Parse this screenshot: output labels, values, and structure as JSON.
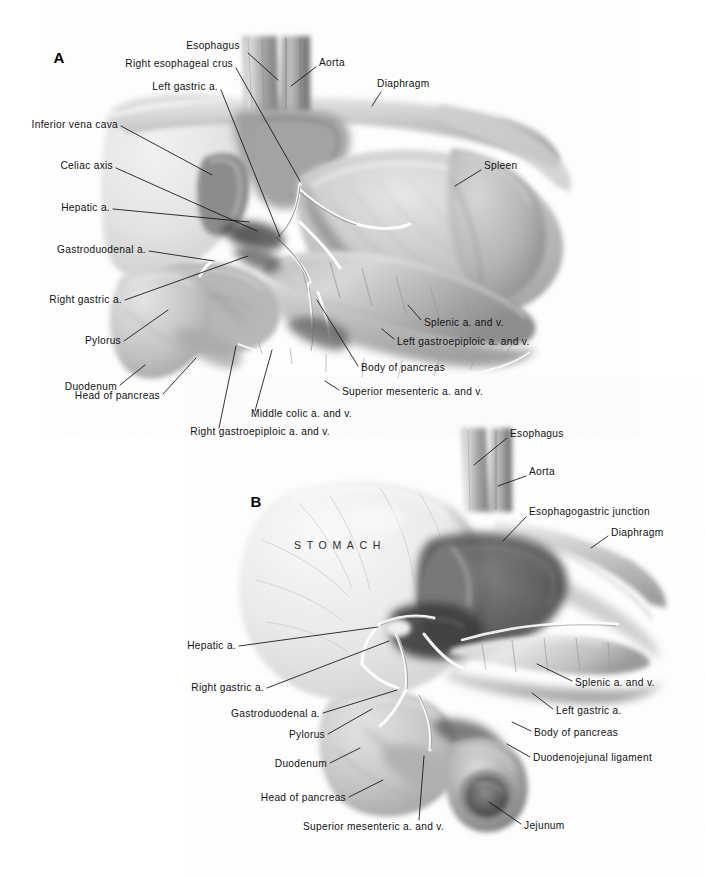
{
  "plate": {
    "kind": "anatomical-illustration",
    "medium": "grayscale wash / airbrush drawing",
    "subject": "Upper abdominal viscera — stomach, pancreas, duodenum and celiac arterial anatomy",
    "background_color": "#ffffff",
    "ink_color": "#121212",
    "figure_count": 2
  },
  "figures": [
    {
      "id": "A",
      "marker": "A",
      "marker_pos": {
        "x": 59,
        "y": 57
      },
      "view": "Anterior view with stomach retracted superiorly, showing celiac axis and pancreas",
      "labels": [
        {
          "name": "esophagus",
          "text": "Esophagus",
          "align": "c",
          "tx": 213,
          "ty": 46,
          "path": "M 248 53 L 278 80"
        },
        {
          "name": "aorta",
          "text": "Aorta",
          "align": "l",
          "tx": 319,
          "ty": 63,
          "path": "M 316 67 L 291 86"
        },
        {
          "name": "right-esophageal-crus",
          "text": "Right esophageal crus",
          "align": "r",
          "tx": 233,
          "ty": 64,
          "path": "M 236 68 L 300 181"
        },
        {
          "name": "diaphragm",
          "text": "Diaphragm",
          "align": "l",
          "tx": 377,
          "ty": 84,
          "path": "M 381 92 L 372 106"
        },
        {
          "name": "left-gastric-a",
          "text": "Left gastric a.",
          "align": "r",
          "tx": 218,
          "ty": 87,
          "path": "M 221 90 L 280 237"
        },
        {
          "name": "inferior-vena-cava",
          "text": "Inferior vena cava",
          "align": "r",
          "tx": 118,
          "ty": 125,
          "path": "M 121 126 L 212 175"
        },
        {
          "name": "spleen",
          "text": "Spleen",
          "align": "l",
          "tx": 484,
          "ty": 166,
          "path": "M 481 170 L 455 186"
        },
        {
          "name": "celiac-axis",
          "text": "Celiac axis",
          "align": "r",
          "tx": 113,
          "ty": 166,
          "path": "M 116 168 L 257 231"
        },
        {
          "name": "hepatic-a",
          "text": "Hepatic a.",
          "align": "r",
          "tx": 110,
          "ty": 208,
          "path": "M 113 209 L 249 222"
        },
        {
          "name": "gastroduodenal-a",
          "text": "Gastroduodenal a.",
          "align": "r",
          "tx": 146,
          "ty": 250,
          "path": "M 149 251 L 214 261"
        },
        {
          "name": "right-gastric-a",
          "text": "Right  gastric a.",
          "align": "r",
          "tx": 122,
          "ty": 300,
          "path": "M 125 300 L 248 256"
        },
        {
          "name": "splenic-a-and-v",
          "text": "Splenic a. and v.",
          "align": "l",
          "tx": 424,
          "ty": 323,
          "path": "M 421 320 L 408 305"
        },
        {
          "name": "left-gastroepiploic",
          "text": "Left gastroepiploic a. and v.",
          "align": "l",
          "tx": 397,
          "ty": 342,
          "path": "M 394 339 L 382 329"
        },
        {
          "name": "pylorus",
          "text": "Pylorus",
          "align": "r",
          "tx": 121,
          "ty": 341,
          "path": "M 124 341 L 168 310"
        },
        {
          "name": "body-of-pancreas",
          "text": "Body of pancreas",
          "align": "l",
          "tx": 361,
          "ty": 368,
          "path": "M 358 366 L 317 300"
        },
        {
          "name": "duodenum",
          "text": "Duodenum",
          "align": "r",
          "tx": 117,
          "ty": 387,
          "path": "M 120 385 L 145 365"
        },
        {
          "name": "superior-mesenteric",
          "text": "Superior mesenteric a. and v.",
          "align": "l",
          "tx": 342,
          "ty": 392,
          "path": "M 339 390 L 325 381"
        },
        {
          "name": "head-of-pancreas",
          "text": "Head of pancreas",
          "align": "r",
          "tx": 160,
          "ty": 396,
          "path": "M 163 394 L 196 358"
        },
        {
          "name": "middle-colic",
          "text": "Middle colic a. and v.",
          "align": "r",
          "tx": 352,
          "ty": 414,
          "path": "M 255 411 L 272 350"
        },
        {
          "name": "right-gastroepiploic",
          "text": "Right gastroepiploic a.  and v.",
          "align": "r",
          "tx": 330,
          "ty": 432,
          "path": "M 219 428 L 236 346"
        }
      ]
    },
    {
      "id": "B",
      "marker": "B",
      "marker_pos": {
        "x": 256,
        "y": 501
      },
      "view": "Stomach reflected, lesser sac opened — esophagogastric junction and pancreas exposed",
      "organ_label": {
        "name": "stomach",
        "text": "STOMACH",
        "tx": 340,
        "ty": 545
      },
      "labels": [
        {
          "name": "esophagus",
          "text": "Esophagus",
          "align": "l",
          "tx": 510,
          "ty": 434,
          "path": "M 507 438 L 474 465"
        },
        {
          "name": "aorta",
          "text": "Aorta",
          "align": "l",
          "tx": 529,
          "ty": 472,
          "path": "M 526 476 L 498 486"
        },
        {
          "name": "esophagogastric-junction",
          "text": "Esophagogastric junction",
          "align": "l",
          "tx": 529,
          "ty": 512,
          "path": "M 526 517 L 503 541"
        },
        {
          "name": "diaphragm",
          "text": "Diaphragm",
          "align": "l",
          "tx": 611,
          "ty": 533,
          "path": "M 608 536 L 591 548"
        },
        {
          "name": "hepatic-a",
          "text": "Hepatic a.",
          "align": "r",
          "tx": 236,
          "ty": 646,
          "path": "M 239 646 L 378 627"
        },
        {
          "name": "splenic-a-and-v",
          "text": "Splenic a. and v.",
          "align": "l",
          "tx": 575,
          "ty": 683,
          "path": "M 572 681 L 537 664"
        },
        {
          "name": "right-gastric-a",
          "text": "Right gastric a.",
          "align": "r",
          "tx": 264,
          "ty": 688,
          "path": "M 267 688 L 389 641"
        },
        {
          "name": "left-gastric-a",
          "text": "Left gastric a.",
          "align": "l",
          "tx": 556,
          "ty": 711,
          "path": "M 553 709 L 532 693"
        },
        {
          "name": "gastroduodenal-a",
          "text": "Gastroduodenal a.",
          "align": "r",
          "tx": 320,
          "ty": 714,
          "path": "M 323 713 L 397 690"
        },
        {
          "name": "body-of-pancreas",
          "text": "Body of pancreas",
          "align": "l",
          "tx": 534,
          "ty": 733,
          "path": "M 531 731 L 512 722"
        },
        {
          "name": "pylorus",
          "text": "Pylorus",
          "align": "r",
          "tx": 325,
          "ty": 735,
          "path": "M 328 734 L 372 709"
        },
        {
          "name": "duodenojejunal-ligament",
          "text": "Duodenojejunal ligament",
          "align": "l",
          "tx": 533,
          "ty": 758,
          "path": "M 530 757 L 507 744"
        },
        {
          "name": "duodenum",
          "text": "Duodenum",
          "align": "r",
          "tx": 327,
          "ty": 764,
          "path": "M 330 763 L 360 748"
        },
        {
          "name": "head-of-pancreas",
          "text": "Head of pancreas",
          "align": "r",
          "tx": 346,
          "ty": 798,
          "path": "M 349 797 L 383 780"
        },
        {
          "name": "jejunum",
          "text": "Jejunum",
          "align": "l",
          "tx": 524,
          "ty": 826,
          "path": "M 521 824 L 489 802"
        },
        {
          "name": "superior-mesenteric",
          "text": "Superior mesenteric a. and v.",
          "align": "r",
          "tx": 444,
          "ty": 827,
          "path": "M 419 820 L 424 756"
        }
      ]
    }
  ]
}
